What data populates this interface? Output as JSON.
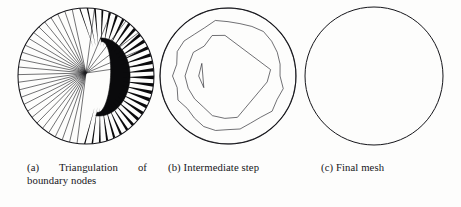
{
  "figure": {
    "kind": "scanned-figure",
    "panel_count": 3,
    "background_color": "#fdfdfc",
    "ink_color": "#16161a",
    "captions": [
      {
        "label": "(a)",
        "text_line1": "Triangulation of",
        "text_line2": "boundary nodes",
        "full": "(a) Triangulation of boundary nodes"
      },
      {
        "label": "(b)",
        "text_line1": "Intermediate step",
        "text_line2": "",
        "full": "(b) Intermediate step"
      },
      {
        "label": "(c)",
        "text_line1": "Final mesh",
        "text_line2": "",
        "full": "(c) Final mesh"
      }
    ]
  },
  "chart_data": {
    "type": "diagram",
    "panels": [
      {
        "id": "a",
        "caption": "(a) Triangulation of boundary nodes",
        "domain": "circle",
        "circle": {
          "cx": 78,
          "cy": 76,
          "r": 68
        },
        "hub": {
          "x": 78,
          "y": 73
        },
        "radial_spokes": 56,
        "obstacle": "black-crescent",
        "node_markers": false,
        "description": "Radial spokes from boundary nodes converge to an interior hub; the obstacle region is solid black."
      },
      {
        "id": "b",
        "caption": "(b) Intermediate step",
        "domain": "circle",
        "circle": {
          "cx": 76,
          "cy": 76,
          "r": 68
        },
        "mesh_rings": 5,
        "coarse_triangles_approx": 190,
        "refined_cluster": "crescent",
        "node_markers": true,
        "description": "Coarse Delaunay triangulation filling the disc with a densely refined crescent cluster right of centre."
      },
      {
        "id": "c",
        "caption": "(c) Final mesh",
        "domain": "circle",
        "circle": {
          "cx": 76,
          "cy": 76,
          "r": 69
        },
        "mesh_rings": 9,
        "fine_triangles_approx": 900,
        "refined_cluster": "crescent",
        "node_markers": true,
        "description": "Uniformly fine triangular mesh over the whole disc with a dark highly-refined crescent region."
      }
    ]
  }
}
